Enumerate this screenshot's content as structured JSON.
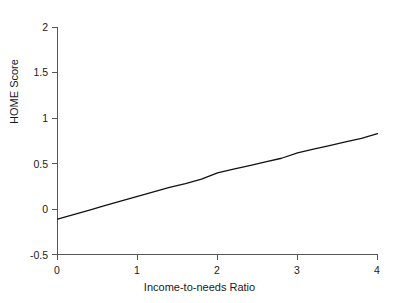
{
  "chart_data": {
    "type": "line",
    "title": "",
    "xlabel": "Income-to-needs Ratio",
    "ylabel": "HOME Score",
    "xlim": [
      0,
      4
    ],
    "ylim": [
      -0.5,
      2
    ],
    "grid": false,
    "legend": null,
    "xticks": [
      {
        "value": 0,
        "label": "0"
      },
      {
        "value": 1,
        "label": "1"
      },
      {
        "value": 2,
        "label": "2"
      },
      {
        "value": 3,
        "label": "3"
      },
      {
        "value": 4,
        "label": "4"
      }
    ],
    "yticks": [
      {
        "value": -0.5,
        "label": "-0.5"
      },
      {
        "value": 0,
        "label": "0"
      },
      {
        "value": 0.5,
        "label": "0.5"
      },
      {
        "value": 1,
        "label": "1"
      },
      {
        "value": 1.5,
        "label": "1.5"
      },
      {
        "value": 2,
        "label": "2"
      }
    ],
    "series": [
      {
        "name": "HOME Score vs Income-to-needs Ratio",
        "color": "#111111",
        "x": [
          0.0,
          0.2,
          0.4,
          0.6,
          0.8,
          1.0,
          1.2,
          1.4,
          1.6,
          1.8,
          2.0,
          2.2,
          2.4,
          2.6,
          2.8,
          3.0,
          3.2,
          3.4,
          3.6,
          3.8,
          4.0
        ],
        "y": [
          -0.11,
          -0.06,
          -0.01,
          0.04,
          0.09,
          0.14,
          0.19,
          0.24,
          0.28,
          0.33,
          0.4,
          0.44,
          0.48,
          0.52,
          0.56,
          0.62,
          0.66,
          0.7,
          0.74,
          0.78,
          0.83
        ]
      }
    ]
  },
  "axes": {
    "x_label": "Income-to-needs Ratio",
    "y_label": "HOME Score"
  }
}
